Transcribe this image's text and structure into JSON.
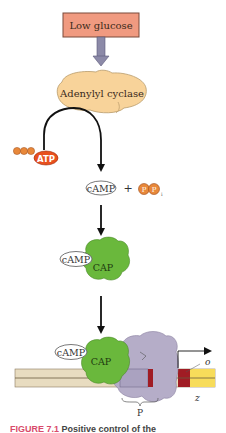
{
  "diagram": {
    "signal_box": {
      "label": "Low glucose",
      "fill": "#f09a80",
      "stroke": "#7a4a3a"
    },
    "enzyme": {
      "label": "Adenylyl cyclase",
      "fill": "#f8d39a"
    },
    "substrate": {
      "label": "ATP",
      "fill": "#e8501e",
      "phosphate_color": "#e8883a"
    },
    "products": {
      "camp_label": "cAMP",
      "plus": "+",
      "ppi_left": "P",
      "ppi_right": "P",
      "ppi_subscript": "i"
    },
    "complex": {
      "camp_label": "cAMP",
      "cap_label": "CAP",
      "cap_fill": "#6ab83c"
    },
    "dna_binding": {
      "camp_label": "cAMP",
      "cap_label": "CAP",
      "polymerase_fill": "#b5adc8",
      "operator_label": "o",
      "gene_label": "z",
      "promoter_label": "P",
      "dna_fill": "#e8dcc0",
      "operator_fill": "#a01c24",
      "gene_fill": "#f7dc5a"
    }
  },
  "caption": {
    "figure_label": "FIGURE 7.1",
    "text": "Positive control of the"
  }
}
